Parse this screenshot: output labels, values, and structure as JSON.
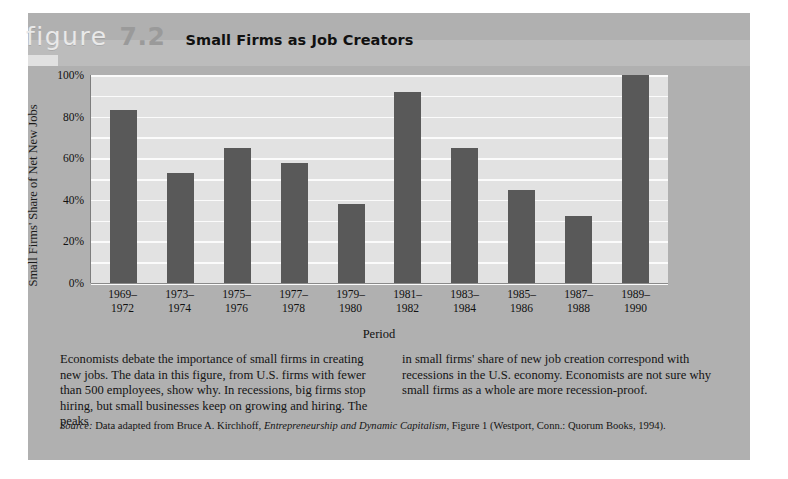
{
  "figure": {
    "label": "figure",
    "number": "7.2",
    "title": "Small Firms as Job Creators"
  },
  "chart_data": {
    "type": "bar",
    "title": "Small Firms as Job Creators",
    "xlabel": "Period",
    "ylabel": "Small Firms' Share of Net New Jobs",
    "categories": [
      "1969–\n1972",
      "1973–\n1974",
      "1975–\n1976",
      "1977–\n1978",
      "1979–\n1980",
      "1981–\n1982",
      "1983–\n1984",
      "1985–\n1986",
      "1987–\n1988",
      "1989–\n1990"
    ],
    "categories_lines": [
      [
        "1969–",
        "1972"
      ],
      [
        "1973–",
        "1974"
      ],
      [
        "1975–",
        "1976"
      ],
      [
        "1977–",
        "1978"
      ],
      [
        "1979–",
        "1980"
      ],
      [
        "1981–",
        "1982"
      ],
      [
        "1983–",
        "1984"
      ],
      [
        "1985–",
        "1986"
      ],
      [
        "1987–",
        "1988"
      ],
      [
        "1989–",
        "1990"
      ]
    ],
    "values": [
      83,
      53,
      65,
      57.5,
      38,
      92,
      65,
      44.5,
      32,
      100
    ],
    "ylim": [
      0,
      100
    ],
    "ytick_labels": [
      "100%",
      "80%",
      "60%",
      "40%",
      "20%",
      "0%"
    ],
    "ytick_values": [
      100,
      80,
      60,
      40,
      20,
      0
    ],
    "gridline_interval": 10,
    "grid": true,
    "legend": "none",
    "bar_color": "#595959",
    "plot_background": "#e2e2e2",
    "gridline_color": "#fbfbfb"
  },
  "caption": {
    "left": "Economists debate the importance of small firms in creating new jobs. The data in this figure, from U.S. firms with fewer than 500 employees, show why. In recessions, big firms stop hiring, but small businesses keep on growing and hiring. The peaks",
    "right": "in small firms' share of new job creation correspond with recessions in the U.S. economy. Economists are not sure why small firms as a whole are more recession-proof."
  },
  "source": {
    "lead": "Source:",
    "text_before_italic": " Data adapted from Bruce A. Kirchhoff, ",
    "italic_title": "Entrepreneurship and Dynamic Capitalism",
    "text_after_italic": ", Figure 1 (Westport, Conn.: Quorum Books, 1994)."
  },
  "colors": {
    "panel": "#b0b0b0",
    "page": "#ffffff",
    "bar": "#595959",
    "accent_number": "#9a9a9a"
  }
}
